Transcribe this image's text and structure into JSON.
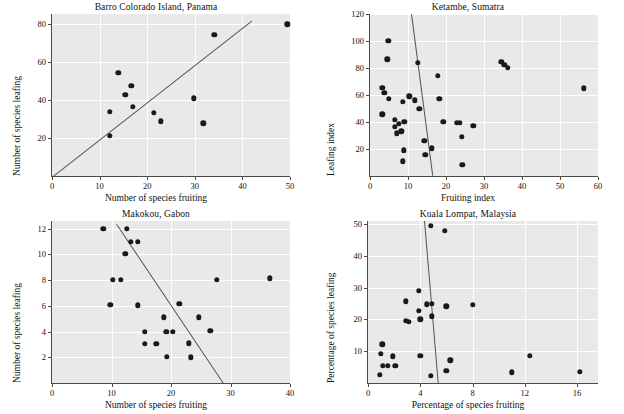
{
  "figure": {
    "panel_bg": "#e9e9e9",
    "grid_color": "#ffffff",
    "point_color": "#1a1a1a",
    "line_color": "#545454"
  },
  "chart_data": [
    {
      "type": "scatter",
      "title": "Barro Colorado Island, Panama",
      "xlabel": "Number of species fruiting",
      "ylabel": "Number of species leafing",
      "xlim": [
        0,
        50
      ],
      "ylim": [
        0,
        85
      ],
      "xticks": [
        0,
        10,
        20,
        30,
        40,
        50
      ],
      "yticks": [
        20,
        40,
        60,
        80
      ],
      "grid": true,
      "legend": "none",
      "points": [
        {
          "x": 12.2,
          "y": 21.2
        },
        {
          "x": 12.1,
          "y": 33.8
        },
        {
          "x": 13.9,
          "y": 54.3
        },
        {
          "x": 15.4,
          "y": 42.5
        },
        {
          "x": 16.7,
          "y": 47.3
        },
        {
          "x": 17.0,
          "y": 36.3
        },
        {
          "x": 21.4,
          "y": 33.2
        },
        {
          "x": 22.9,
          "y": 28.8
        },
        {
          "x": 29.8,
          "y": 40.7
        },
        {
          "x": 31.8,
          "y": 27.6
        },
        {
          "x": 34.1,
          "y": 74.2
        },
        {
          "x": 49.4,
          "y": 79.6
        }
      ],
      "fit_line": {
        "x0": 0.3,
        "y0": 0.0,
        "x1": 42.0,
        "y1": 81.5,
        "slope_sign": "positive"
      }
    },
    {
      "type": "scatter",
      "title": "Ketambe, Sumatra",
      "xlabel": "Fruiting index",
      "ylabel": "Leafing index",
      "xlim": [
        0,
        60
      ],
      "ylim": [
        0,
        120
      ],
      "xticks": [
        0,
        10,
        20,
        30,
        40,
        50,
        60
      ],
      "yticks": [
        20,
        40,
        60,
        80,
        100,
        120
      ],
      "grid": true,
      "legend": "none",
      "points": [
        {
          "x": 3.2,
          "y": 65.5
        },
        {
          "x": 3.2,
          "y": 45.8
        },
        {
          "x": 3.8,
          "y": 61.5
        },
        {
          "x": 4.8,
          "y": 100.2
        },
        {
          "x": 4.6,
          "y": 86.5
        },
        {
          "x": 5.0,
          "y": 57.0
        },
        {
          "x": 6.6,
          "y": 41.8
        },
        {
          "x": 6.6,
          "y": 36.3
        },
        {
          "x": 7.1,
          "y": 31.5
        },
        {
          "x": 7.6,
          "y": 38.5
        },
        {
          "x": 8.2,
          "y": 33.0
        },
        {
          "x": 8.6,
          "y": 55.0
        },
        {
          "x": 9.0,
          "y": 40.0
        },
        {
          "x": 8.9,
          "y": 19.0
        },
        {
          "x": 8.7,
          "y": 10.8
        },
        {
          "x": 10.3,
          "y": 59.0
        },
        {
          "x": 11.8,
          "y": 56.0
        },
        {
          "x": 12.5,
          "y": 84.0
        },
        {
          "x": 13.0,
          "y": 50.0
        },
        {
          "x": 14.3,
          "y": 26.0
        },
        {
          "x": 14.6,
          "y": 15.5
        },
        {
          "x": 16.2,
          "y": 20.5
        },
        {
          "x": 17.8,
          "y": 74.0
        },
        {
          "x": 18.2,
          "y": 57.0
        },
        {
          "x": 19.3,
          "y": 40.0
        },
        {
          "x": 22.8,
          "y": 39.5
        },
        {
          "x": 23.7,
          "y": 39.5
        },
        {
          "x": 24.2,
          "y": 29.0
        },
        {
          "x": 24.3,
          "y": 8.5
        },
        {
          "x": 27.2,
          "y": 37.0
        },
        {
          "x": 34.6,
          "y": 84.5
        },
        {
          "x": 35.3,
          "y": 82.5
        },
        {
          "x": 36.2,
          "y": 80.0
        },
        {
          "x": 56.3,
          "y": 65.0
        }
      ],
      "fit_line": {
        "x0": 11.0,
        "y0": 120.0,
        "x1": 16.6,
        "y1": 0.0,
        "slope_sign": "negative"
      }
    },
    {
      "type": "scatter",
      "title": "Makokou, Gabon",
      "xlabel": "Number of species fruiting",
      "ylabel": "Number of species leafing",
      "xlim": [
        0,
        40
      ],
      "ylim": [
        0,
        12.6
      ],
      "xticks": [
        0,
        10,
        20,
        30,
        40
      ],
      "yticks": [
        2,
        4,
        6,
        8,
        10,
        12
      ],
      "grid": true,
      "legend": "none",
      "points": [
        {
          "x": 8.6,
          "y": 12.0
        },
        {
          "x": 9.8,
          "y": 6.1
        },
        {
          "x": 10.2,
          "y": 8.05
        },
        {
          "x": 11.6,
          "y": 8.05
        },
        {
          "x": 12.3,
          "y": 10.05
        },
        {
          "x": 12.6,
          "y": 12.0
        },
        {
          "x": 13.2,
          "y": 11.0
        },
        {
          "x": 14.4,
          "y": 11.0
        },
        {
          "x": 14.4,
          "y": 6.05
        },
        {
          "x": 15.6,
          "y": 4.0
        },
        {
          "x": 15.6,
          "y": 3.05
        },
        {
          "x": 17.5,
          "y": 3.05
        },
        {
          "x": 18.8,
          "y": 5.1
        },
        {
          "x": 19.2,
          "y": 4.0
        },
        {
          "x": 19.3,
          "y": 2.05
        },
        {
          "x": 20.3,
          "y": 4.0
        },
        {
          "x": 21.4,
          "y": 6.15
        },
        {
          "x": 23.0,
          "y": 3.1
        },
        {
          "x": 23.3,
          "y": 2.0
        },
        {
          "x": 24.7,
          "y": 5.1
        },
        {
          "x": 26.6,
          "y": 4.05
        },
        {
          "x": 27.7,
          "y": 8.05
        },
        {
          "x": 36.6,
          "y": 8.15
        }
      ],
      "fit_line": {
        "x0": 11.0,
        "y0": 12.4,
        "x1": 29.0,
        "y1": 0.0,
        "slope_sign": "negative"
      }
    },
    {
      "type": "scatter",
      "title": "Kuala Lompat, Malaysia",
      "xlabel": "Percentage of species fruiting",
      "ylabel": "Percentage of species leafing",
      "xlim": [
        0,
        17.6
      ],
      "ylim": [
        0,
        51
      ],
      "xticks": [
        0,
        4,
        8,
        12,
        16
      ],
      "yticks": [
        10,
        20,
        30,
        40,
        50
      ],
      "grid": true,
      "legend": "none",
      "points": [
        {
          "x": 0.9,
          "y": 2.5
        },
        {
          "x": 1.0,
          "y": 9.2
        },
        {
          "x": 1.1,
          "y": 12.2
        },
        {
          "x": 1.15,
          "y": 5.5
        },
        {
          "x": 1.5,
          "y": 5.4
        },
        {
          "x": 1.9,
          "y": 8.4
        },
        {
          "x": 2.1,
          "y": 5.4
        },
        {
          "x": 2.9,
          "y": 25.7
        },
        {
          "x": 2.9,
          "y": 19.6
        },
        {
          "x": 3.1,
          "y": 19.2
        },
        {
          "x": 3.9,
          "y": 29.0
        },
        {
          "x": 3.9,
          "y": 22.8
        },
        {
          "x": 4.0,
          "y": 20.0
        },
        {
          "x": 4.0,
          "y": 8.5
        },
        {
          "x": 4.5,
          "y": 24.8
        },
        {
          "x": 4.8,
          "y": 49.5
        },
        {
          "x": 4.9,
          "y": 25.0
        },
        {
          "x": 4.9,
          "y": 21.0
        },
        {
          "x": 4.8,
          "y": 2.3
        },
        {
          "x": 5.9,
          "y": 48.0
        },
        {
          "x": 6.0,
          "y": 24.2
        },
        {
          "x": 6.0,
          "y": 3.9
        },
        {
          "x": 6.3,
          "y": 7.1
        },
        {
          "x": 8.0,
          "y": 24.6
        },
        {
          "x": 11.0,
          "y": 3.4
        },
        {
          "x": 12.4,
          "y": 8.5
        },
        {
          "x": 16.2,
          "y": 3.5
        }
      ],
      "fit_line": {
        "x0": 4.35,
        "y0": 51.0,
        "x1": 5.4,
        "y1": 0.0,
        "slope_sign": "negative"
      }
    }
  ]
}
